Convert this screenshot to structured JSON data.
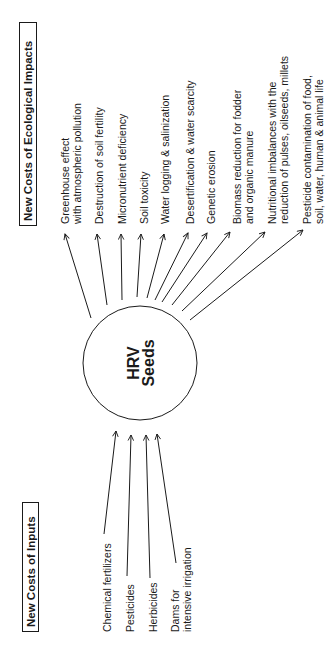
{
  "diagram": {
    "center": {
      "line1": "HRV",
      "line2": "Seeds"
    },
    "outputs_header": "New Costs of Ecological Impacts",
    "inputs_header": "New Costs of Inputs",
    "outputs": [
      {
        "lines": [
          "Greenhouse effect",
          "with atmospheric pollution"
        ]
      },
      {
        "lines": [
          "Destruction of soil fertility"
        ]
      },
      {
        "lines": [
          "Micronutrient deficiency"
        ]
      },
      {
        "lines": [
          "Soil toxicity"
        ]
      },
      {
        "lines": [
          "Water logging & salinization"
        ]
      },
      {
        "lines": [
          "Desertification & water scarcity"
        ]
      },
      {
        "lines": [
          "Genetic erosion"
        ]
      },
      {
        "lines": [
          "Biomass reduction for fodder",
          "and organic manure"
        ]
      },
      {
        "lines": [
          "Nutritional imbalances with the",
          "reduction of pulses, oilseeds, millets"
        ]
      },
      {
        "lines": [
          "Pesticide contamination of food,",
          "soil, water, human & animal life"
        ]
      }
    ],
    "inputs": [
      {
        "lines": [
          "Chemical fertilizers"
        ]
      },
      {
        "lines": [
          "Pesticides"
        ]
      },
      {
        "lines": [
          "Herbicides"
        ]
      },
      {
        "lines": [
          "Dams for",
          "intensive irrigation"
        ]
      }
    ]
  }
}
